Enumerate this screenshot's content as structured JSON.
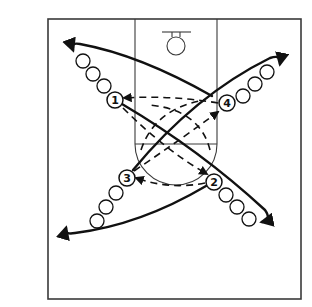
{
  "diagram": {
    "type": "basketball-drill",
    "players": [
      {
        "label": "1",
        "id": "p1"
      },
      {
        "label": "2",
        "id": "p2"
      },
      {
        "label": "3",
        "id": "p3"
      },
      {
        "label": "4",
        "id": "p4"
      }
    ],
    "queues": {
      "p1": 3,
      "p2": 3,
      "p3": 3,
      "p4": 3
    },
    "colors": {
      "line": "#111111",
      "court": "#3a3a3a",
      "background": "#ffffff"
    }
  }
}
